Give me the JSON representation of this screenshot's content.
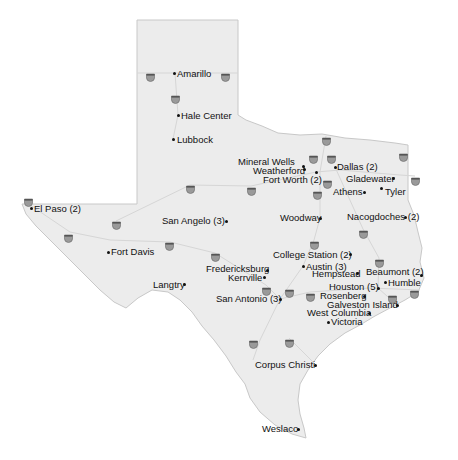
{
  "map": {
    "title": "Texas",
    "fill_color": "#ececec",
    "border_color": "#c8c8c8",
    "road_color": "#d8d8d8",
    "label_color": "#111111"
  },
  "cities": [
    {
      "name": "Amarillo",
      "x": 174,
      "y": 73,
      "lx": 177,
      "ly": 68,
      "align": "left"
    },
    {
      "name": "Hale Center",
      "x": 178,
      "y": 115,
      "lx": 181,
      "ly": 110,
      "align": "left"
    },
    {
      "name": "Lubbock",
      "x": 173,
      "y": 139,
      "lx": 177,
      "ly": 134,
      "align": "left"
    },
    {
      "name": "Mineral Wells",
      "x": 303,
      "y": 166,
      "lx": 238,
      "ly": 156,
      "align": "left"
    },
    {
      "name": "Weatherford",
      "x": 304,
      "y": 169,
      "lx": 253,
      "ly": 165,
      "align": "left"
    },
    {
      "name": "Fort Worth (2)",
      "x": 316,
      "y": 172,
      "lx": 263,
      "ly": 174,
      "align": "left"
    },
    {
      "name": "Dallas (2)",
      "x": 335,
      "y": 167,
      "lx": 337,
      "ly": 161,
      "align": "left"
    },
    {
      "name": "Gladewater",
      "x": 393,
      "y": 178,
      "lx": 346,
      "ly": 173,
      "align": "left"
    },
    {
      "name": "Athens",
      "x": 364,
      "y": 192,
      "lx": 333,
      "ly": 186,
      "align": "left"
    },
    {
      "name": "Tyler",
      "x": 381,
      "y": 188,
      "lx": 385,
      "ly": 186,
      "align": "left"
    },
    {
      "name": "El Paso (2)",
      "x": 31,
      "y": 208,
      "lx": 34,
      "ly": 203,
      "align": "left"
    },
    {
      "name": "San Angelo (3)",
      "x": 226,
      "y": 221,
      "lx": 162,
      "ly": 215,
      "align": "left"
    },
    {
      "name": "Woodway",
      "x": 320,
      "y": 218,
      "lx": 280,
      "ly": 212,
      "align": "left"
    },
    {
      "name": "Nacogdoches (2)",
      "x": 405,
      "y": 217,
      "lx": 347,
      "ly": 211,
      "align": "left"
    },
    {
      "name": "Fort Davis",
      "x": 108,
      "y": 252,
      "lx": 111,
      "ly": 246,
      "align": "left"
    },
    {
      "name": "College Station (2)",
      "x": 350,
      "y": 254,
      "lx": 273,
      "ly": 249,
      "align": "left"
    },
    {
      "name": "Austin (3)",
      "x": 303,
      "y": 266,
      "lx": 306,
      "ly": 261,
      "align": "left"
    },
    {
      "name": "Hempstead",
      "x": 357,
      "y": 273,
      "lx": 312,
      "ly": 268,
      "align": "left"
    },
    {
      "name": "Fredericksburg",
      "x": 267,
      "y": 270,
      "lx": 206,
      "ly": 263,
      "align": "left"
    },
    {
      "name": "Kerrville",
      "x": 264,
      "y": 277,
      "lx": 228,
      "ly": 272,
      "align": "left"
    },
    {
      "name": "Beaumont (2)",
      "x": 421,
      "y": 275,
      "lx": 366,
      "ly": 266,
      "align": "left"
    },
    {
      "name": "Humble",
      "x": 385,
      "y": 282,
      "lx": 388,
      "ly": 277,
      "align": "left"
    },
    {
      "name": "Langtry",
      "x": 184,
      "y": 284,
      "lx": 153,
      "ly": 279,
      "align": "left"
    },
    {
      "name": "Houston (5)",
      "x": 378,
      "y": 288,
      "lx": 329,
      "ly": 281,
      "align": "left"
    },
    {
      "name": "Rosenberg",
      "x": 364,
      "y": 296,
      "lx": 320,
      "ly": 290,
      "align": "left"
    },
    {
      "name": "San Antonio (3)",
      "x": 280,
      "y": 299,
      "lx": 216,
      "ly": 293,
      "align": "left"
    },
    {
      "name": "Galveston Island",
      "x": 397,
      "y": 305,
      "lx": 327,
      "ly": 299,
      "align": "left"
    },
    {
      "name": "West Columbia",
      "x": 369,
      "y": 313,
      "lx": 307,
      "ly": 307,
      "align": "left"
    },
    {
      "name": "Victoria",
      "x": 328,
      "y": 322,
      "lx": 331,
      "ly": 316,
      "align": "left"
    },
    {
      "name": "Corpus Christi",
      "x": 315,
      "y": 365,
      "lx": 255,
      "ly": 359,
      "align": "left"
    },
    {
      "name": "Weslaco",
      "x": 298,
      "y": 429,
      "lx": 262,
      "ly": 423,
      "align": "left"
    }
  ],
  "shields": [
    {
      "route": "40",
      "x": 150,
      "y": 72
    },
    {
      "route": "40",
      "x": 225,
      "y": 72
    },
    {
      "route": "27",
      "x": 175,
      "y": 94
    },
    {
      "route": "35",
      "x": 326,
      "y": 136
    },
    {
      "route": "35W",
      "x": 313,
      "y": 154
    },
    {
      "route": "35E",
      "x": 331,
      "y": 154
    },
    {
      "route": "20",
      "x": 403,
      "y": 152
    },
    {
      "route": "20",
      "x": 251,
      "y": 186
    },
    {
      "route": "45",
      "x": 327,
      "y": 179
    },
    {
      "route": "20",
      "x": 317,
      "y": 190
    },
    {
      "route": "20",
      "x": 415,
      "y": 176
    },
    {
      "route": "20",
      "x": 190,
      "y": 184
    },
    {
      "route": "10",
      "x": 28,
      "y": 197
    },
    {
      "route": "20",
      "x": 116,
      "y": 220
    },
    {
      "route": "10",
      "x": 68,
      "y": 233
    },
    {
      "route": "10",
      "x": 169,
      "y": 241
    },
    {
      "route": "45",
      "x": 363,
      "y": 229
    },
    {
      "route": "45",
      "x": 314,
      "y": 240
    },
    {
      "route": "10",
      "x": 215,
      "y": 252
    },
    {
      "route": "10",
      "x": 266,
      "y": 286
    },
    {
      "route": "35",
      "x": 289,
      "y": 288
    },
    {
      "route": "10",
      "x": 310,
      "y": 292
    },
    {
      "route": "45",
      "x": 379,
      "y": 258
    },
    {
      "route": "45",
      "x": 392,
      "y": 294
    },
    {
      "route": "10",
      "x": 414,
      "y": 289
    },
    {
      "route": "37",
      "x": 253,
      "y": 339
    },
    {
      "route": "37",
      "x": 289,
      "y": 338
    }
  ]
}
